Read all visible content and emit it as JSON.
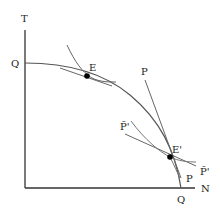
{
  "diagram": {
    "axes": {
      "y_label": "T",
      "x_label": "N"
    },
    "frontier": {
      "name": "production possibility frontier",
      "top_intercept_label": "Q",
      "bottom_intercept_label": "Q"
    },
    "points": [
      {
        "id": "E",
        "label": "E"
      },
      {
        "id": "E_prime",
        "label": "E'"
      }
    ],
    "price_lines": [
      {
        "id": "P",
        "label_top": "P",
        "label_bottom": "P"
      },
      {
        "id": "P_tilde_prime",
        "label_left": "P̃'",
        "label_right": "P̃'"
      }
    ],
    "colors": {
      "line": "#555555",
      "axis": "#333333",
      "point": "#000000"
    }
  }
}
